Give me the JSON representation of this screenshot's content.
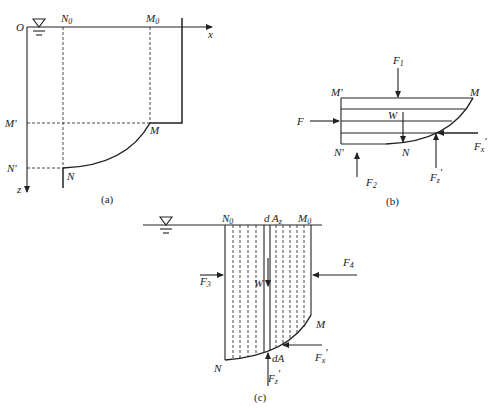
{
  "figure": {
    "panels": [
      {
        "id": "a",
        "caption": "(a)",
        "labels": {
          "origin": "O",
          "x_axis": "x",
          "z_axis": "z",
          "N0": "N",
          "N0_sub": "0",
          "M0": "M",
          "M0_sub": "0",
          "M_prime": "M'",
          "N_prime": "N'",
          "M": "M",
          "N": "N"
        },
        "icons": [
          "free-surface-symbol"
        ]
      },
      {
        "id": "b",
        "caption": "(b)",
        "labels": {
          "F": "F",
          "F1": "F",
          "F1_sub": "1",
          "F2": "F",
          "F2_sub": "2",
          "W": "W",
          "M_prime": "M'",
          "N_prime": "N'",
          "M": "M",
          "N": "N",
          "Fx_prime": "F",
          "Fx_prime_sub": "x",
          "Fz_prime": "F",
          "Fz_prime_sub": "z",
          "prime": "'"
        }
      },
      {
        "id": "c",
        "caption": "(c)",
        "labels": {
          "N0": "N",
          "N0_sub": "0",
          "M0": "M",
          "M0_sub": "0",
          "dAz": "d A",
          "dAz_sub": "z",
          "F3": "F",
          "F3_sub": "3",
          "F4": "F",
          "F4_sub": "4",
          "W": "W",
          "M": "M",
          "N": "N",
          "dA": "dA",
          "Fx_prime": "F",
          "Fx_prime_sub": "x",
          "Fz_prime": "F",
          "Fz_prime_sub": "z",
          "prime": "'"
        },
        "icons": [
          "free-surface-symbol"
        ]
      }
    ]
  }
}
